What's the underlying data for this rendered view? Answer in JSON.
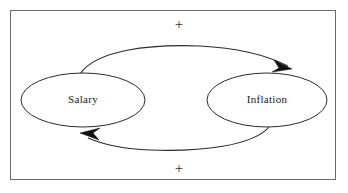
{
  "diagram": {
    "type": "causal-loop-diagram",
    "background_color": "#ffffff",
    "frame": {
      "stroke_color": "#6a6a6a",
      "x": 10,
      "y": 10,
      "width": 326,
      "height": 170
    },
    "nodes": [
      {
        "id": "salary",
        "label": "Salary",
        "cx": 83,
        "cy": 100,
        "rx": 62,
        "ry": 27,
        "stroke_color": "#2b2b2b",
        "fill_color": "#ffffff"
      },
      {
        "id": "inflation",
        "label": "Inflation",
        "cx": 267,
        "cy": 100,
        "rx": 60,
        "ry": 27,
        "stroke_color": "#2b2b2b",
        "fill_color": "#ffffff"
      }
    ],
    "links": [
      {
        "id": "salary-to-inflation",
        "from": "salary",
        "to": "inflation",
        "polarity": "+",
        "position": "top",
        "stroke_color": "#2b2b2b"
      },
      {
        "id": "inflation-to-salary",
        "from": "inflation",
        "to": "salary",
        "polarity": "+",
        "position": "bottom",
        "stroke_color": "#2b2b2b"
      }
    ],
    "polarity_markers": [
      {
        "id": "top-plus",
        "label": "+",
        "x": 179,
        "y": 26
      },
      {
        "id": "bottom-plus",
        "label": "+",
        "x": 179,
        "y": 170
      }
    ]
  }
}
